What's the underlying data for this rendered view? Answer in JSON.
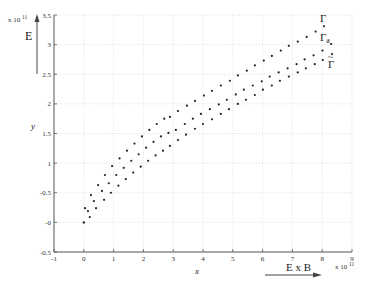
{
  "chart_data": {
    "type": "scatter",
    "title": "",
    "xlabel": "x",
    "ylabel": "y",
    "xlim": [
      -1,
      9
    ],
    "ylim": [
      -0.5,
      3.5
    ],
    "x_ticks": [
      -1,
      0,
      1,
      2,
      3,
      4,
      5,
      6,
      7,
      8,
      9
    ],
    "y_ticks": [
      -0.5,
      0,
      0.5,
      1,
      1.5,
      2,
      2.5,
      3,
      3.5
    ],
    "x_tick_labels": [
      "-1",
      "0",
      "1",
      "2",
      "3",
      "4",
      "5",
      "6",
      "7",
      "8",
      "9"
    ],
    "y_tick_labels": [
      "-0.5",
      "-0",
      "-0.5",
      "1",
      "1.5",
      "2",
      "2.5",
      "3",
      "3.5"
    ],
    "x_multiplier": "x 10",
    "x_multiplier_exp": "11",
    "y_multiplier": "x 10",
    "y_multiplier_exp": "11",
    "grid": true,
    "origin_point": {
      "x": 0.0,
      "y": 0.0
    },
    "series": [
      {
        "name": "Γ",
        "x": [
          0.04,
          0.24,
          0.48,
          0.71,
          0.95,
          1.2,
          1.45,
          1.7,
          1.95,
          2.2,
          2.45,
          2.7,
          2.89,
          3.16,
          3.46,
          3.73,
          4.03,
          4.3,
          4.6,
          4.9,
          5.17,
          5.47,
          5.74,
          6.04,
          6.31,
          6.61,
          6.88,
          7.18,
          7.48,
          7.78,
          8.06
        ],
        "y": [
          0.24,
          0.46,
          0.63,
          0.8,
          0.95,
          1.08,
          1.21,
          1.33,
          1.45,
          1.56,
          1.66,
          1.75,
          1.78,
          1.88,
          1.97,
          2.05,
          2.14,
          2.22,
          2.31,
          2.39,
          2.48,
          2.56,
          2.65,
          2.73,
          2.81,
          2.9,
          2.98,
          3.05,
          3.13,
          3.22,
          3.31
        ]
      },
      {
        "name": "Γa",
        "x": [
          0.14,
          0.34,
          0.61,
          0.84,
          1.09,
          1.34,
          1.59,
          1.84,
          2.09,
          2.34,
          2.59,
          2.84,
          3.09,
          3.39,
          3.66,
          3.93,
          4.23,
          4.53,
          4.8,
          5.1,
          5.37,
          5.67,
          5.97,
          6.24,
          6.54,
          6.84,
          7.14,
          7.41,
          7.71,
          8.01,
          8.3
        ],
        "y": [
          0.19,
          0.36,
          0.53,
          0.66,
          0.8,
          0.92,
          1.04,
          1.15,
          1.26,
          1.36,
          1.45,
          1.51,
          1.56,
          1.66,
          1.75,
          1.83,
          1.91,
          1.99,
          2.07,
          2.16,
          2.24,
          2.31,
          2.38,
          2.46,
          2.53,
          2.6,
          2.67,
          2.75,
          2.82,
          2.9,
          3.01
        ]
      },
      {
        "name": "Γ~",
        "x": [
          0.2,
          0.41,
          0.68,
          0.91,
          1.16,
          1.41,
          1.66,
          1.91,
          2.16,
          2.41,
          2.66,
          2.89,
          3.16,
          3.43,
          3.73,
          4.0,
          4.3,
          4.6,
          4.87,
          5.17,
          5.44,
          5.74,
          6.01,
          6.31,
          6.58,
          6.88,
          7.18,
          7.45,
          7.75,
          8.02,
          8.33
        ],
        "y": [
          0.09,
          0.24,
          0.38,
          0.5,
          0.62,
          0.73,
          0.84,
          0.94,
          1.04,
          1.13,
          1.21,
          1.29,
          1.39,
          1.48,
          1.58,
          1.66,
          1.74,
          1.83,
          1.91,
          2.0,
          2.07,
          2.15,
          2.24,
          2.31,
          2.39,
          2.46,
          2.53,
          2.6,
          2.67,
          2.74,
          2.84
        ]
      }
    ],
    "annotations": {
      "gamma": "Γ",
      "gamma_a_base": "Γ",
      "gamma_a_sub": "a",
      "gamma_tilde_base": "Γ",
      "gamma_tilde_mark": "~",
      "e_field": "E",
      "e_cross_b": "E x B"
    }
  }
}
